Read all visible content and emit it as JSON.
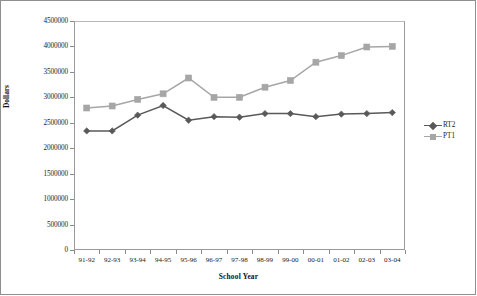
{
  "chart_data": {
    "type": "line",
    "title": "",
    "xlabel": "School Year",
    "ylabel": "Dollars",
    "categories": [
      "91-92",
      "92-93",
      "93-94",
      "94-95",
      "95-96",
      "96-97",
      "97-98",
      "98-99",
      "99-00",
      "00-01",
      "01-02",
      "02-03",
      "03-04"
    ],
    "series": [
      {
        "name": "RT2",
        "color": "#595959",
        "marker": "diamond",
        "values": [
          2340000,
          2340000,
          2650000,
          2840000,
          2550000,
          2620000,
          2610000,
          2680000,
          2680000,
          2620000,
          2670000,
          2680000,
          2700000
        ]
      },
      {
        "name": "PT1",
        "color": "#a6a6a6",
        "marker": "square",
        "values": [
          2790000,
          2830000,
          2960000,
          3070000,
          3380000,
          3000000,
          3000000,
          3200000,
          3330000,
          3690000,
          3820000,
          3990000,
          4000000
        ]
      }
    ],
    "ylim": [
      0,
      4500000
    ],
    "ytick_values": [
      0,
      500000,
      1000000,
      1500000,
      2000000,
      2500000,
      3000000,
      3500000,
      4000000,
      4500000
    ],
    "ytick_labels": [
      "0",
      "500000",
      "1000000",
      "1500000",
      "2000000",
      "2500000",
      "3000000",
      "3500000",
      "4000000",
      "4500000"
    ],
    "grid": true,
    "legend_position": "right",
    "legend_entries": [
      "RT2",
      "PT1"
    ]
  }
}
